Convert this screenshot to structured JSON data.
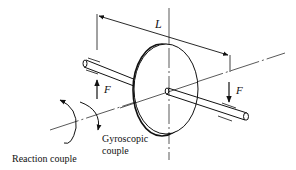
{
  "diagram": {
    "type": "gyroscope-shaft-disc",
    "labels": {
      "length": "L",
      "force_left": "F",
      "force_right": "F",
      "gyroscopic_line1": "Gyroscopic",
      "gyroscopic_line2": "couple",
      "reaction": "Reaction couple"
    },
    "colors": {
      "stroke": "#111111",
      "background": "#ffffff"
    }
  }
}
